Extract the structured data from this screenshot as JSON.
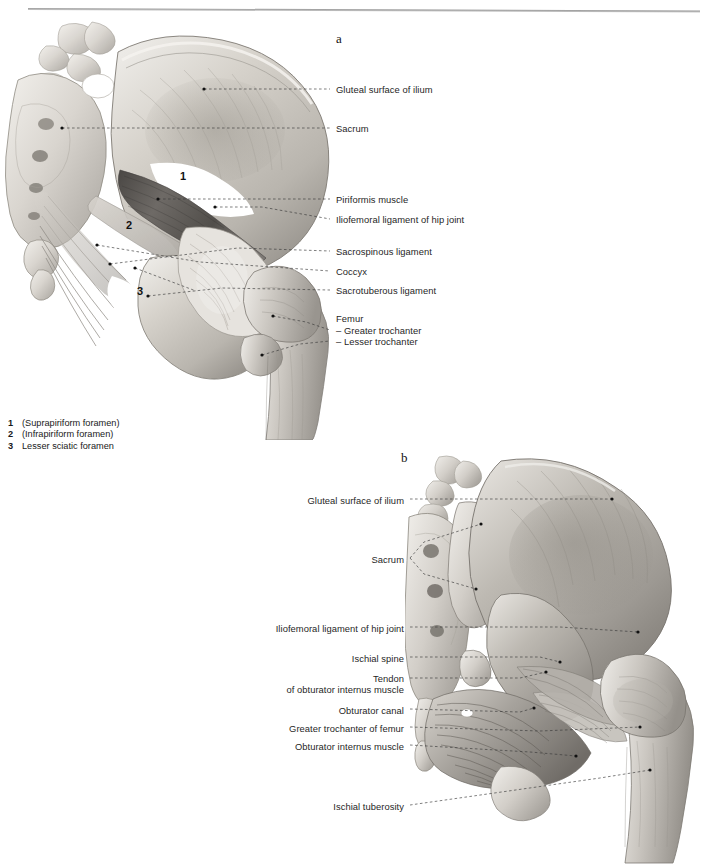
{
  "page": {
    "background": "#ffffff",
    "header_faint_text": "",
    "rule_color": "#9a9a9a"
  },
  "figures": [
    {
      "id": "a",
      "letter": "a"
    },
    {
      "id": "b",
      "letter": "b"
    }
  ],
  "figure_a": {
    "letter": "a",
    "labels": [
      {
        "text": "Gluteal surface of ilium",
        "x": 336,
        "y": 84,
        "align": "left"
      },
      {
        "text": "Sacrum",
        "x": 336,
        "y": 123,
        "align": "left"
      },
      {
        "text": "Piriformis muscle",
        "x": 336,
        "y": 194,
        "align": "left"
      },
      {
        "text": "Iliofemoral ligament of hip joint",
        "x": 336,
        "y": 214,
        "align": "left"
      },
      {
        "text": "Sacrospinous ligament",
        "x": 336,
        "y": 246,
        "align": "left"
      },
      {
        "text": "Coccyx",
        "x": 336,
        "y": 266,
        "align": "left"
      },
      {
        "text": "Sacrotuberous ligament",
        "x": 336,
        "y": 285,
        "align": "left"
      },
      {
        "text": "Femur",
        "x": 336,
        "y": 314,
        "align": "left"
      },
      {
        "text": "– Greater trochanter",
        "x": 336,
        "y": 326,
        "align": "left"
      },
      {
        "text": "– Lesser trochanter",
        "x": 336,
        "y": 337,
        "align": "left"
      }
    ],
    "plate_numbers": [
      {
        "text": "1",
        "x": 180,
        "y": 170
      },
      {
        "text": "2",
        "x": 126,
        "y": 219
      },
      {
        "text": "3",
        "x": 137,
        "y": 285
      }
    ]
  },
  "figure_b": {
    "letter": "b",
    "labels": [
      {
        "text": "Gluteal surface of ilium",
        "x": 404,
        "y": 495,
        "align": "right"
      },
      {
        "text": "Sacrum",
        "x": 404,
        "y": 554,
        "align": "right"
      },
      {
        "text": "Iliofemoral ligament of hip joint",
        "x": 404,
        "y": 623,
        "align": "right"
      },
      {
        "text": "Ischial spine",
        "x": 404,
        "y": 653,
        "align": "right"
      },
      {
        "text": "Tendon",
        "x": 404,
        "y": 673,
        "align": "right"
      },
      {
        "text": "of obturator internus muscle",
        "x": 404,
        "y": 684,
        "align": "right"
      },
      {
        "text": "Obturator canal",
        "x": 404,
        "y": 705,
        "align": "right"
      },
      {
        "text": "Greater trochanter of femur",
        "x": 404,
        "y": 723,
        "align": "right"
      },
      {
        "text": "Obturator internus muscle",
        "x": 404,
        "y": 741,
        "align": "right"
      },
      {
        "text": "Ischial tuberosity",
        "x": 404,
        "y": 801,
        "align": "right"
      }
    ]
  },
  "legend": {
    "items": [
      {
        "num": "1",
        "text": "(Suprapiriform foramen)"
      },
      {
        "num": "2",
        "text": "(Infrapiriform foramen)"
      },
      {
        "num": "3",
        "text": "Lesser sciatic foramen"
      }
    ]
  }
}
